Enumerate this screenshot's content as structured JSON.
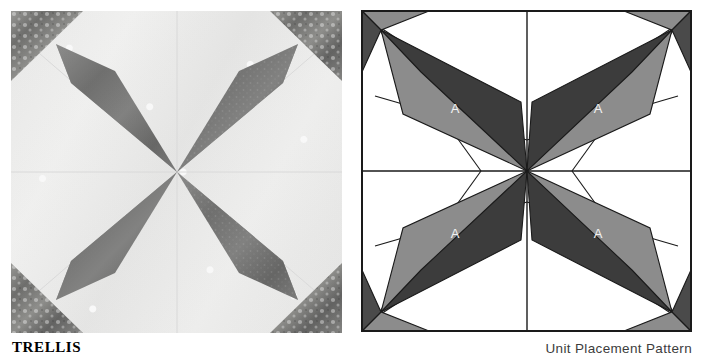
{
  "figure": {
    "block_name": "TRELLIS",
    "pattern_caption": "Unit Placement Pattern",
    "panels": [
      {
        "id": "photo",
        "kind": "photograph",
        "description": "Pieced quilt block photograph"
      },
      {
        "id": "pattern",
        "kind": "line-diagram",
        "description": "Unit placement pattern diagram"
      }
    ]
  },
  "pattern": {
    "unit_labels": [
      "A",
      "A",
      "A",
      "A"
    ],
    "colors": {
      "background": "#ffffff",
      "outline": "#1a1a1a",
      "unit_dark": "#3c3c3c",
      "unit_medium": "#8c8c8c",
      "corner_dark": "#4a4a4a",
      "corner_medium": "#8c8c8c",
      "label_text": "#f2f2f2"
    },
    "geometry": {
      "grid": "2x2 quadrants with center seam lines",
      "center": "171,161",
      "units_per_block": 4,
      "unit_name": "A"
    }
  },
  "photo": {
    "colors": {
      "background_cloth": "#f0f0ee",
      "star_print": "#ffffff",
      "diamond_dark": "#7d7d7d",
      "diamond_accent": "#a8a8a6",
      "corner_print": "#8a8a88",
      "seam_line": "#dcdcda"
    },
    "description": "Four dark diamonds radiating from the block centre, each paired with a mottled light-print strip; dark printed triangles fill the four corners on a pale star-print ground."
  }
}
